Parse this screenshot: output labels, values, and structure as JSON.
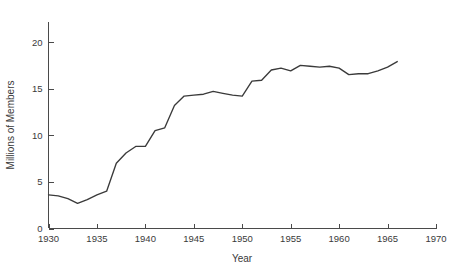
{
  "chart_data": {
    "type": "line",
    "title": "",
    "xlabel": "Year",
    "ylabel": "Millions of Members",
    "xlim": [
      1930,
      1970
    ],
    "ylim": [
      0,
      21.5
    ],
    "grid": false,
    "legend": null,
    "xticks": [
      1930,
      1935,
      1940,
      1945,
      1950,
      1955,
      1960,
      1965,
      1970
    ],
    "xtick_labels": [
      "1930",
      "1935",
      "1940",
      "1945",
      "1950",
      "1955",
      "1960",
      "1965",
      "1970"
    ],
    "yticks": [
      0,
      5,
      10,
      15,
      20
    ],
    "ytick_labels": [
      "0",
      "5",
      "10",
      "15",
      "20"
    ],
    "line_color": "#3a3a3a",
    "series": [
      {
        "name": "Union Membership",
        "x": [
          1930,
          1931,
          1932,
          1933,
          1934,
          1935,
          1936,
          1937,
          1938,
          1939,
          1940,
          1941,
          1942,
          1943,
          1944,
          1945,
          1946,
          1947,
          1948,
          1949,
          1950,
          1951,
          1952,
          1953,
          1954,
          1955,
          1956,
          1957,
          1958,
          1959,
          1960,
          1961,
          1962,
          1963,
          1964,
          1965,
          1966
        ],
        "values": [
          3.6,
          3.5,
          3.2,
          2.7,
          3.1,
          3.6,
          4.0,
          7.0,
          8.1,
          8.8,
          8.8,
          10.5,
          10.8,
          13.2,
          14.2,
          14.3,
          14.4,
          14.7,
          14.5,
          14.3,
          14.2,
          15.8,
          15.9,
          17.0,
          17.2,
          16.9,
          17.5,
          17.4,
          17.3,
          17.4,
          17.2,
          16.5,
          16.6,
          16.6,
          16.9,
          17.3,
          17.9
        ]
      }
    ]
  },
  "axes": {
    "x_axis_name": "Year",
    "y_axis_name": "Millions of Members"
  }
}
